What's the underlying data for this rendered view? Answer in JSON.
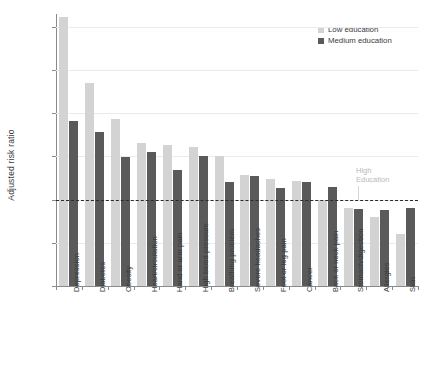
{
  "chart_data": {
    "type": "bar",
    "title": "",
    "xlabel": "",
    "ylabel": "Adjusted risk ratio",
    "ylim": [
      0,
      3.15
    ],
    "yticks": [
      0,
      0.5,
      1.0,
      1.5,
      2.0,
      2.5,
      3.0
    ],
    "ytick_labels": [
      "0",
      "0.5",
      "1.0",
      "1.5",
      "2.0",
      "2.5",
      "3.0"
    ],
    "grid": true,
    "legend_position": "top-right",
    "categories": [
      "Depression",
      "Diabetes",
      "Obesity",
      "Heart/circulation",
      "Hand or arm pain",
      "High blood pressure",
      "Breathing problem",
      "Severe headaches",
      "Foot or leg pain",
      "Cancer",
      "Back or neck pain",
      "Stomach/digestion",
      "Allergies",
      "Skin"
    ],
    "series": [
      {
        "name": "Low education",
        "color": "#d3d3d3",
        "values": [
          3.12,
          2.35,
          1.93,
          1.66,
          1.63,
          1.61,
          1.5,
          1.28,
          1.24,
          1.22,
          1.0,
          0.9,
          0.8,
          0.6
        ]
      },
      {
        "name": "Medium education",
        "color": "#5a5a5a",
        "values": [
          1.91,
          1.78,
          1.49,
          1.55,
          1.34,
          1.5,
          1.2,
          1.27,
          1.13,
          1.21,
          1.15,
          0.89,
          0.88,
          0.9
        ]
      }
    ],
    "reference_line": {
      "value": 1.0,
      "label": "High\nEducation",
      "label_line1": "High",
      "label_line2": "Education",
      "style": "dashed",
      "color": "#2b2b2b"
    }
  },
  "legend": {
    "items": [
      {
        "label": "Low education",
        "color": "#d3d3d3"
      },
      {
        "label": "Medium education",
        "color": "#5a5a5a"
      }
    ]
  }
}
